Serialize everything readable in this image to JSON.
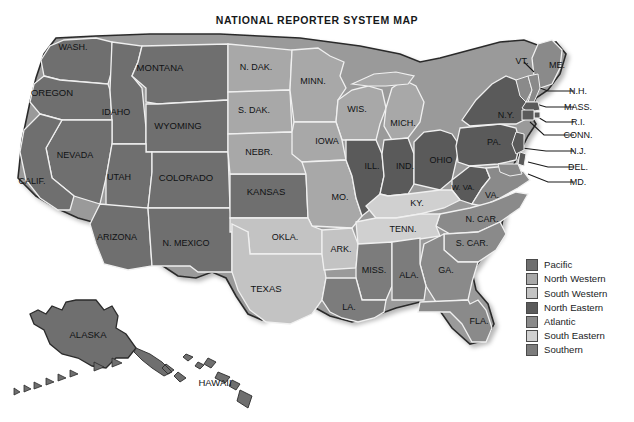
{
  "title": "NATIONAL REPORTER SYSTEM MAP",
  "colors": {
    "pacific": "#6f6f6f",
    "north_western": "#a8a8a8",
    "south_western": "#c3c3c3",
    "north_eastern": "#5a5a5a",
    "atlantic": "#8a8a8a",
    "south_eastern": "#d0d0d0",
    "southern": "#7c7c7c",
    "outline": "#2b2b2b",
    "internal_border": "#f0f0f0",
    "label": "#101214",
    "background": "#ffffff"
  },
  "legend": {
    "items": [
      {
        "label": "Pacific",
        "color_key": "pacific",
        "color": "#6f6f6f"
      },
      {
        "label": "North Western",
        "color_key": "north_western",
        "color": "#a8a8a8"
      },
      {
        "label": "South Western",
        "color_key": "south_western",
        "color": "#c3c3c3"
      },
      {
        "label": "North Eastern",
        "color_key": "north_eastern",
        "color": "#5a5a5a"
      },
      {
        "label": "Atlantic",
        "color_key": "atlantic",
        "color": "#8a8a8a"
      },
      {
        "label": "South Eastern",
        "color_key": "south_eastern",
        "color": "#d0d0d0"
      },
      {
        "label": "Southern",
        "color_key": "southern",
        "color": "#7c7c7c"
      }
    ]
  },
  "map": {
    "state_labels": [
      {
        "text": "WASH.",
        "x": 73,
        "y": 22,
        "size": 9,
        "region": "pacific"
      },
      {
        "text": "OREGON",
        "x": 52,
        "y": 68,
        "size": 9.5,
        "region": "pacific"
      },
      {
        "text": "IDAHO",
        "x": 116,
        "y": 87,
        "size": 9,
        "region": "pacific"
      },
      {
        "text": "MONTANA",
        "x": 160,
        "y": 43,
        "size": 9.5,
        "region": "pacific"
      },
      {
        "text": "NEVADA",
        "x": 75,
        "y": 130,
        "size": 9,
        "region": "pacific"
      },
      {
        "text": "CALIF.",
        "x": 32,
        "y": 156,
        "size": 9,
        "region": "pacific"
      },
      {
        "text": "UTAH",
        "x": 119,
        "y": 152,
        "size": 9,
        "region": "pacific"
      },
      {
        "text": "WYOMING",
        "x": 178,
        "y": 101,
        "size": 9.5,
        "region": "pacific"
      },
      {
        "text": "COLORADO",
        "x": 186,
        "y": 153,
        "size": 9.5,
        "region": "pacific"
      },
      {
        "text": "ARIZONA",
        "x": 117,
        "y": 212,
        "size": 9,
        "region": "pacific"
      },
      {
        "text": "N. MEXICO",
        "x": 186,
        "y": 218,
        "size": 9,
        "region": "pacific"
      },
      {
        "text": "KANSAS",
        "x": 266,
        "y": 167,
        "size": 9.5,
        "region": "pacific"
      },
      {
        "text": "ALASKA",
        "x": 88,
        "y": 310,
        "size": 9.5,
        "region": "pacific"
      },
      {
        "text": "HAWAII",
        "x": 215,
        "y": 358,
        "size": 9.5,
        "region": "pacific"
      },
      {
        "text": "N. DAK.",
        "x": 256,
        "y": 42,
        "size": 9,
        "region": "north_western"
      },
      {
        "text": "S. DAK.",
        "x": 254,
        "y": 85,
        "size": 9,
        "region": "north_western"
      },
      {
        "text": "NEBR.",
        "x": 259,
        "y": 127,
        "size": 9,
        "region": "north_western"
      },
      {
        "text": "MINN.",
        "x": 313,
        "y": 56,
        "size": 9,
        "region": "north_western"
      },
      {
        "text": "WIS.",
        "x": 357,
        "y": 84,
        "size": 9,
        "region": "north_western"
      },
      {
        "text": "IOWA",
        "x": 327,
        "y": 116,
        "size": 9,
        "region": "north_western"
      },
      {
        "text": "MO.",
        "x": 340,
        "y": 172,
        "size": 9,
        "region": "north_western"
      },
      {
        "text": "MICH.",
        "x": 403,
        "y": 98,
        "size": 9,
        "region": "north_western"
      },
      {
        "text": "OKLA.",
        "x": 285,
        "y": 212,
        "size": 9,
        "region": "south_western"
      },
      {
        "text": "TEXAS",
        "x": 266,
        "y": 264,
        "size": 9.5,
        "region": "south_western"
      },
      {
        "text": "ARK.",
        "x": 341,
        "y": 224,
        "size": 9,
        "region": "south_western"
      },
      {
        "text": "ILL.",
        "x": 372,
        "y": 141,
        "size": 9,
        "region": "north_eastern"
      },
      {
        "text": "IND.",
        "x": 405,
        "y": 141,
        "size": 9,
        "region": "north_eastern"
      },
      {
        "text": "OHIO",
        "x": 441,
        "y": 135,
        "size": 9,
        "region": "north_eastern"
      },
      {
        "text": "PA.",
        "x": 494,
        "y": 117,
        "size": 9,
        "region": "north_eastern"
      },
      {
        "text": "N.Y.",
        "x": 506,
        "y": 90,
        "size": 9,
        "region": "north_eastern"
      },
      {
        "text": "W. VA.",
        "x": 463,
        "y": 162,
        "size": 7.8,
        "region": "north_eastern"
      },
      {
        "text": "KY.",
        "x": 417,
        "y": 178,
        "size": 9,
        "region": "south_eastern"
      },
      {
        "text": "TENN.",
        "x": 403,
        "y": 204,
        "size": 9,
        "region": "south_eastern"
      },
      {
        "text": "VA.",
        "x": 492,
        "y": 170,
        "size": 9,
        "region": "atlantic"
      },
      {
        "text": "N. CAR.",
        "x": 482,
        "y": 194,
        "size": 9,
        "region": "atlantic"
      },
      {
        "text": "S. CAR.",
        "x": 472,
        "y": 218,
        "size": 9,
        "region": "atlantic"
      },
      {
        "text": "GA.",
        "x": 446,
        "y": 245,
        "size": 9,
        "region": "atlantic"
      },
      {
        "text": "FLA.",
        "x": 479,
        "y": 296,
        "size": 9,
        "region": "atlantic"
      },
      {
        "text": "ME.",
        "x": 557,
        "y": 40,
        "size": 9,
        "region": "atlantic"
      },
      {
        "text": "MISS.",
        "x": 374,
        "y": 245,
        "size": 9,
        "region": "southern"
      },
      {
        "text": "ALA.",
        "x": 409,
        "y": 250,
        "size": 9,
        "region": "southern"
      },
      {
        "text": "LA.",
        "x": 349,
        "y": 282,
        "size": 9,
        "region": "southern"
      }
    ],
    "callout_labels": [
      {
        "text": "VT.",
        "x": 522,
        "y": 36,
        "size": 9,
        "anchor": "end"
      },
      {
        "text": "N.H.",
        "x": 578,
        "y": 66,
        "size": 9,
        "anchor": "start"
      },
      {
        "text": "MASS.",
        "x": 578,
        "y": 82,
        "size": 9,
        "anchor": "start"
      },
      {
        "text": "R.I.",
        "x": 578,
        "y": 97,
        "size": 9,
        "anchor": "start"
      },
      {
        "text": "CONN.",
        "x": 578,
        "y": 110,
        "size": 9,
        "anchor": "start"
      },
      {
        "text": "N.J.",
        "x": 578,
        "y": 126,
        "size": 9,
        "anchor": "start"
      },
      {
        "text": "DEL.",
        "x": 578,
        "y": 142,
        "size": 9,
        "anchor": "start"
      },
      {
        "text": "MD.",
        "x": 578,
        "y": 157,
        "size": 9,
        "anchor": "start"
      }
    ]
  }
}
